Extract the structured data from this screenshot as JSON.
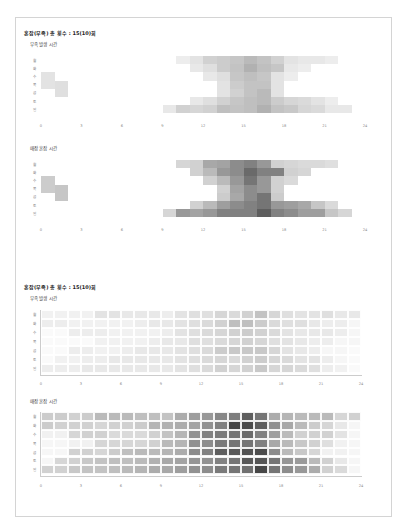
{
  "sections": [
    {
      "title": "혼잡(부족) 총 횟수 : 15(10)회",
      "charts": [
        {
          "title": "부족 발생 시간"
        },
        {
          "title": "매장 혼잡 시간"
        }
      ]
    },
    {
      "title": "혼잡(부족) 총 횟수 : 15(10)회",
      "charts": [
        {
          "title": "부족 발생 시간"
        },
        {
          "title": "매장 혼잡 시간"
        }
      ]
    }
  ],
  "chart_data": [
    {
      "type": "heatmap",
      "title": "부족 발생 시간",
      "section": "혼잡(부족) 총 횟수 : 15(10)회",
      "x_ticks": [
        0,
        3,
        6,
        9,
        12,
        15,
        18,
        21,
        24
      ],
      "y_labels": [
        "월",
        "화",
        "수",
        "목",
        "금",
        "토",
        "일",
        ""
      ],
      "xlim": [
        0,
        24
      ],
      "grid": false,
      "color": "#000000",
      "rows": [
        [
          0,
          0,
          0,
          0,
          0,
          0,
          0,
          0,
          0,
          0,
          0.08,
          0.12,
          0.2,
          0.22,
          0.25,
          0.3,
          0.26,
          0.2,
          0.12,
          0.1,
          0.1,
          0.08,
          0,
          0
        ],
        [
          0,
          0,
          0,
          0,
          0,
          0,
          0,
          0,
          0,
          0,
          0,
          0.1,
          0.14,
          0.22,
          0.26,
          0.34,
          0.28,
          0.25,
          0.1,
          0.08,
          0,
          0,
          0,
          0
        ],
        [
          0.12,
          0,
          0,
          0,
          0,
          0,
          0,
          0,
          0,
          0,
          0,
          0,
          0.1,
          0.14,
          0.25,
          0.28,
          0.25,
          0.12,
          0.08,
          0,
          0,
          0,
          0,
          0
        ],
        [
          0.12,
          0.14,
          0,
          0,
          0,
          0,
          0,
          0,
          0,
          0,
          0,
          0,
          0,
          0.12,
          0.22,
          0.26,
          0.26,
          0.12,
          0,
          0,
          0,
          0,
          0,
          0
        ],
        [
          0,
          0.14,
          0,
          0,
          0,
          0,
          0,
          0,
          0,
          0,
          0,
          0,
          0,
          0.12,
          0.2,
          0.26,
          0.3,
          0.12,
          0,
          0,
          0,
          0,
          0,
          0
        ],
        [
          0,
          0,
          0,
          0,
          0,
          0,
          0,
          0,
          0,
          0,
          0,
          0.1,
          0.14,
          0.2,
          0.25,
          0.28,
          0.3,
          0.22,
          0.18,
          0.16,
          0.12,
          0.08,
          0,
          0
        ],
        [
          0,
          0,
          0,
          0,
          0,
          0,
          0,
          0,
          0,
          0.1,
          0.2,
          0.18,
          0.2,
          0.28,
          0.26,
          0.28,
          0.34,
          0.26,
          0.24,
          0.18,
          0.16,
          0.1,
          0.1,
          0
        ],
        [
          0,
          0,
          0,
          0,
          0,
          0,
          0,
          0,
          0,
          0,
          0,
          0,
          0,
          0,
          0,
          0,
          0,
          0,
          0,
          0,
          0,
          0,
          0,
          0
        ]
      ]
    },
    {
      "type": "heatmap",
      "title": "매장 혼잡 시간",
      "section": "혼잡(부족) 총 횟수 : 15(10)회",
      "x_ticks": [
        0,
        3,
        6,
        9,
        12,
        15,
        18,
        21,
        24
      ],
      "y_labels": [
        "월",
        "화",
        "수",
        "목",
        "금",
        "토",
        "일",
        ""
      ],
      "xlim": [
        0,
        24
      ],
      "grid": false,
      "color": "#000000",
      "rows": [
        [
          0,
          0,
          0,
          0,
          0,
          0,
          0,
          0,
          0,
          0,
          0.18,
          0.2,
          0.38,
          0.4,
          0.5,
          0.55,
          0.45,
          0.2,
          0.18,
          0.16,
          0.16,
          0.14,
          0,
          0
        ],
        [
          0,
          0,
          0,
          0,
          0,
          0,
          0,
          0,
          0,
          0,
          0,
          0.2,
          0.3,
          0.45,
          0.5,
          0.65,
          0.55,
          0.55,
          0.2,
          0.18,
          0,
          0,
          0,
          0
        ],
        [
          0.22,
          0,
          0,
          0,
          0,
          0,
          0,
          0,
          0,
          0,
          0,
          0,
          0.2,
          0.3,
          0.45,
          0.6,
          0.45,
          0.2,
          0.16,
          0,
          0,
          0,
          0,
          0
        ],
        [
          0.22,
          0.25,
          0,
          0,
          0,
          0,
          0,
          0,
          0,
          0,
          0,
          0,
          0,
          0.2,
          0.4,
          0.5,
          0.45,
          0.2,
          0,
          0,
          0,
          0,
          0,
          0
        ],
        [
          0,
          0.25,
          0,
          0,
          0,
          0,
          0,
          0,
          0,
          0,
          0,
          0,
          0,
          0.22,
          0.38,
          0.5,
          0.6,
          0.22,
          0,
          0,
          0,
          0,
          0,
          0
        ],
        [
          0,
          0,
          0,
          0,
          0,
          0,
          0,
          0,
          0,
          0,
          0,
          0.2,
          0.3,
          0.42,
          0.5,
          0.55,
          0.6,
          0.45,
          0.42,
          0.38,
          0.25,
          0.16,
          0,
          0
        ],
        [
          0,
          0,
          0,
          0,
          0,
          0,
          0,
          0,
          0,
          0.18,
          0.45,
          0.4,
          0.45,
          0.55,
          0.55,
          0.55,
          0.7,
          0.55,
          0.5,
          0.42,
          0.42,
          0.25,
          0.18,
          0
        ],
        [
          0,
          0,
          0,
          0,
          0,
          0,
          0,
          0,
          0,
          0,
          0,
          0,
          0,
          0,
          0,
          0,
          0,
          0,
          0,
          0,
          0,
          0,
          0,
          0
        ]
      ]
    },
    {
      "type": "heatmap",
      "title": "부족 발생 시간",
      "section": "혼잡(부족) 총 횟수 : 15(10)회",
      "x_ticks": [
        0,
        3,
        6,
        9,
        12,
        15,
        18,
        21,
        24
      ],
      "y_labels": [
        "월",
        "화",
        "수",
        "목",
        "금",
        "토",
        "일"
      ],
      "xlim": [
        0,
        24
      ],
      "grid": true,
      "color": "#000000",
      "rows": [
        [
          0.06,
          0.06,
          0.06,
          0.06,
          0.12,
          0.12,
          0.1,
          0.1,
          0.1,
          0.08,
          0.12,
          0.14,
          0.14,
          0.18,
          0.16,
          0.2,
          0.26,
          0.18,
          0.14,
          0.12,
          0.12,
          0.14,
          0.1,
          0.1
        ],
        [
          0.08,
          0.08,
          0.06,
          0.06,
          0.06,
          0.06,
          0.06,
          0.08,
          0.1,
          0.1,
          0.12,
          0.14,
          0.16,
          0.2,
          0.28,
          0.28,
          0.22,
          0.16,
          0.14,
          0.14,
          0.1,
          0.08,
          0.08,
          0.04
        ],
        [
          0.02,
          0.02,
          0.08,
          0.08,
          0.08,
          0.06,
          0.06,
          0.06,
          0.06,
          0.08,
          0.12,
          0.14,
          0.16,
          0.18,
          0.2,
          0.22,
          0.2,
          0.16,
          0.12,
          0.1,
          0.1,
          0.1,
          0.08,
          0.04
        ],
        [
          0.02,
          0.02,
          0.02,
          0.02,
          0.06,
          0.06,
          0.06,
          0.06,
          0.08,
          0.1,
          0.1,
          0.14,
          0.14,
          0.16,
          0.18,
          0.2,
          0.18,
          0.14,
          0.12,
          0.1,
          0.08,
          0.08,
          0.04,
          0.04
        ],
        [
          0.02,
          0.02,
          0.08,
          0.08,
          0.06,
          0.06,
          0.08,
          0.1,
          0.1,
          0.1,
          0.12,
          0.14,
          0.16,
          0.22,
          0.24,
          0.24,
          0.24,
          0.18,
          0.12,
          0.1,
          0.08,
          0.04,
          0.04,
          0.02
        ],
        [
          0.02,
          0.06,
          0.06,
          0.08,
          0.08,
          0.1,
          0.1,
          0.1,
          0.1,
          0.1,
          0.12,
          0.14,
          0.16,
          0.18,
          0.16,
          0.2,
          0.22,
          0.18,
          0.16,
          0.12,
          0.12,
          0.08,
          0.04,
          0.02
        ],
        [
          0.08,
          0.08,
          0.08,
          0.1,
          0.1,
          0.1,
          0.1,
          0.1,
          0.1,
          0.1,
          0.12,
          0.14,
          0.16,
          0.2,
          0.18,
          0.2,
          0.24,
          0.18,
          0.18,
          0.16,
          0.14,
          0.08,
          0.06,
          0.02
        ]
      ]
    },
    {
      "type": "heatmap",
      "title": "매장 혼잡 시간",
      "section": "혼잡(부족) 총 횟수 : 15(10)회",
      "x_ticks": [
        0,
        3,
        6,
        9,
        12,
        15,
        18,
        21,
        24
      ],
      "y_labels": [
        "월",
        "화",
        "수",
        "목",
        "금",
        "토",
        "일"
      ],
      "xlim": [
        0,
        24
      ],
      "grid": true,
      "color": "#000000",
      "rows": [
        [
          0.22,
          0.22,
          0.2,
          0.22,
          0.3,
          0.3,
          0.3,
          0.28,
          0.28,
          0.26,
          0.36,
          0.42,
          0.45,
          0.52,
          0.56,
          0.7,
          0.6,
          0.36,
          0.32,
          0.3,
          0.3,
          0.3,
          0.18,
          0.2
        ],
        [
          0.22,
          0.2,
          0.2,
          0.2,
          0.18,
          0.2,
          0.2,
          0.22,
          0.32,
          0.34,
          0.36,
          0.4,
          0.48,
          0.55,
          0.8,
          0.78,
          0.7,
          0.48,
          0.38,
          0.3,
          0.22,
          0.18,
          0.1,
          0.04
        ],
        [
          0.06,
          0.06,
          0.18,
          0.2,
          0.2,
          0.16,
          0.16,
          0.16,
          0.2,
          0.26,
          0.32,
          0.48,
          0.55,
          0.58,
          0.6,
          0.65,
          0.55,
          0.42,
          0.3,
          0.2,
          0.2,
          0.2,
          0.12,
          0.04
        ],
        [
          0.04,
          0.04,
          0.06,
          0.06,
          0.18,
          0.18,
          0.18,
          0.18,
          0.2,
          0.3,
          0.32,
          0.48,
          0.5,
          0.58,
          0.6,
          0.6,
          0.55,
          0.38,
          0.3,
          0.24,
          0.2,
          0.14,
          0.06,
          0.04
        ],
        [
          0.04,
          0.04,
          0.2,
          0.2,
          0.18,
          0.22,
          0.28,
          0.3,
          0.3,
          0.32,
          0.36,
          0.5,
          0.55,
          0.7,
          0.72,
          0.75,
          0.78,
          0.5,
          0.3,
          0.24,
          0.18,
          0.06,
          0.06,
          0.04
        ],
        [
          0.04,
          0.18,
          0.2,
          0.24,
          0.26,
          0.28,
          0.28,
          0.3,
          0.34,
          0.38,
          0.4,
          0.46,
          0.48,
          0.55,
          0.6,
          0.72,
          0.74,
          0.6,
          0.46,
          0.44,
          0.3,
          0.2,
          0.1,
          0.04
        ],
        [
          0.2,
          0.2,
          0.24,
          0.26,
          0.26,
          0.28,
          0.3,
          0.32,
          0.36,
          0.38,
          0.42,
          0.48,
          0.5,
          0.58,
          0.6,
          0.62,
          0.8,
          0.6,
          0.5,
          0.45,
          0.36,
          0.2,
          0.16,
          0.04
        ]
      ]
    }
  ]
}
